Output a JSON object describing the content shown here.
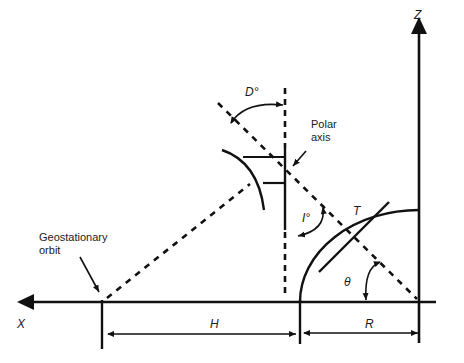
{
  "diagram": {
    "type": "geometry-figure",
    "axes": {
      "x_label": "X",
      "z_label": "Z"
    },
    "labels": {
      "geostationary": "Geostationary\norbit",
      "polar_axis": "Polar\naxis",
      "declination": "D°",
      "inclination": "I°",
      "tangent": "T",
      "angle": "θ",
      "height": "H",
      "radius": "R"
    },
    "colors": {
      "line": "#111111",
      "background": "#ffffff"
    }
  }
}
